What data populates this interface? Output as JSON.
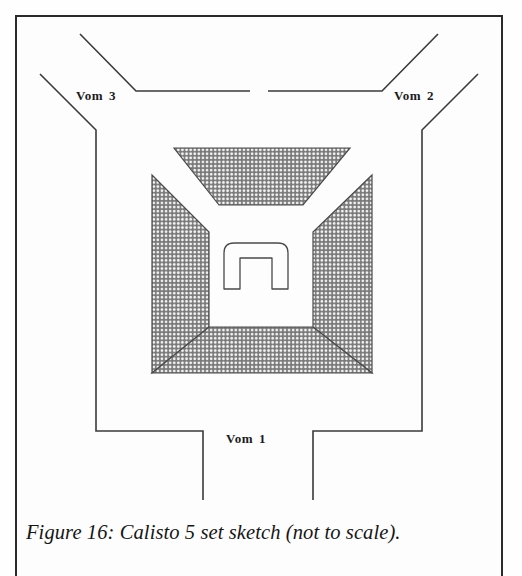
{
  "figure": {
    "caption": "Figure 16: Calisto 5 set sketch (not to scale).",
    "title": "Calisto 5 set sketch",
    "scale_note": "not to scale",
    "figure_number": "Figure 16"
  },
  "labels": {
    "vom1": {
      "name": "Vom",
      "number": "1",
      "full": "Vom 1"
    },
    "vom2": {
      "name": "Vom",
      "number": "2",
      "full": "Vom 2"
    },
    "vom3": {
      "name": "Vom",
      "number": "3",
      "full": "Vom 3"
    }
  },
  "colors": {
    "ink": "#2a2a2a",
    "line": "#3a3a3a",
    "hatch_dark": "#6e6e6e",
    "hatch_light": "#f2f2f2",
    "paper": "#fefefe"
  },
  "diagram": {
    "type": "set-sketch",
    "elements": [
      {
        "name": "bank-upstage",
        "shape": "trapezoid",
        "hatched": true
      },
      {
        "name": "bank-house-left",
        "shape": "trapezoid",
        "hatched": true
      },
      {
        "name": "bank-house-right",
        "shape": "trapezoid",
        "hatched": true
      },
      {
        "name": "bank-downstage",
        "shape": "trapezoid",
        "hatched": true
      },
      {
        "name": "central-portal",
        "shape": "rounded-arch-with-square-opening",
        "hatched": false
      },
      {
        "name": "vom-1-aisle",
        "orientation": "vertical-bottom"
      },
      {
        "name": "vom-2-aisle",
        "orientation": "diagonal-top-right"
      },
      {
        "name": "vom-3-aisle",
        "orientation": "diagonal-top-left"
      }
    ]
  }
}
